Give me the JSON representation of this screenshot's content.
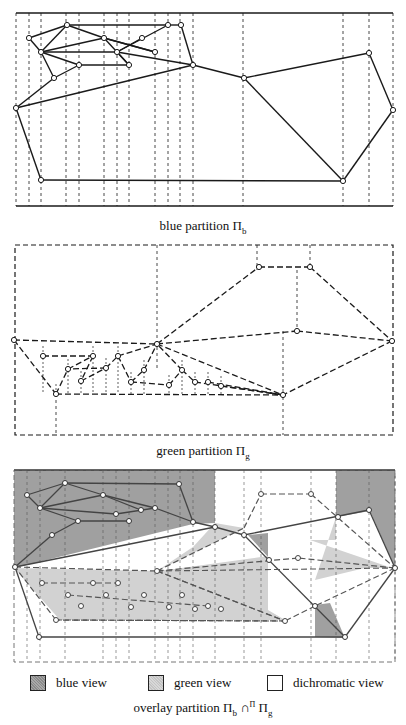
{
  "colors": {
    "line": "#1a1a1a",
    "blue_view": "#a0a0a0",
    "green_view": "#d2d2d2",
    "dichromatic_view": "#ffffff"
  },
  "captions": {
    "blue": {
      "text": "blue partition Π",
      "sub": "b"
    },
    "green": {
      "text": "green partition Π",
      "sub": "g"
    },
    "overlay": {
      "pre": "overlay partition Π",
      "sub1": "b",
      "op": " ∩",
      "sup": "Π",
      "post": " Π",
      "sub2": "g"
    }
  },
  "legend": [
    {
      "key": "blue",
      "label": "blue view"
    },
    {
      "key": "green",
      "label": "green view"
    },
    {
      "key": "dichromatic",
      "label": "dichromatic view"
    }
  ],
  "diagrams": {
    "blue": {
      "frame": [
        16,
        13,
        393,
        206
      ],
      "vlines": [
        16,
        29,
        41,
        66,
        79,
        104,
        117,
        129,
        155,
        168,
        180,
        193,
        243,
        343,
        369,
        393
      ],
      "nodes": [
        [
          67,
          25
        ],
        [
          168,
          25
        ],
        [
          181,
          25
        ],
        [
          29,
          38
        ],
        [
          104,
          38
        ],
        [
          142,
          38
        ],
        [
          41,
          52
        ],
        [
          117,
          52
        ],
        [
          155,
          52
        ],
        [
          79,
          65
        ],
        [
          129,
          65
        ],
        [
          193,
          65
        ],
        [
          54,
          78
        ],
        [
          244,
          78
        ],
        [
          369,
          53
        ],
        [
          16,
          108
        ],
        [
          393,
          110
        ],
        [
          41,
          180
        ],
        [
          343,
          181
        ]
      ],
      "edges": [
        [
          0,
          1
        ],
        [
          0,
          3
        ],
        [
          0,
          6
        ],
        [
          0,
          4
        ],
        [
          1,
          2
        ],
        [
          1,
          7
        ],
        [
          2,
          11
        ],
        [
          3,
          6
        ],
        [
          6,
          4
        ],
        [
          6,
          7
        ],
        [
          6,
          9
        ],
        [
          6,
          12
        ],
        [
          4,
          8
        ],
        [
          4,
          7
        ],
        [
          5,
          7
        ],
        [
          7,
          10
        ],
        [
          7,
          11
        ],
        [
          8,
          4
        ],
        [
          9,
          12
        ],
        [
          9,
          10
        ],
        [
          10,
          7
        ],
        [
          11,
          13
        ],
        [
          12,
          15
        ],
        [
          15,
          11
        ],
        [
          13,
          14
        ],
        [
          13,
          18
        ],
        [
          14,
          16
        ],
        [
          16,
          18
        ],
        [
          15,
          17
        ],
        [
          17,
          18
        ]
      ]
    },
    "green": {
      "frame": [
        15,
        245,
        393,
        435
      ],
      "nodes": [
        [
          14,
          340
        ],
        [
          157,
          344
        ],
        [
          259,
          267
        ],
        [
          310,
          267
        ],
        [
          297,
          331
        ],
        [
          392,
          341
        ],
        [
          283,
          395
        ],
        [
          43,
          356
        ],
        [
          68,
          369
        ],
        [
          93,
          356
        ],
        [
          106,
          368
        ],
        [
          118,
          356
        ],
        [
          81,
          381
        ],
        [
          131,
          382
        ],
        [
          144,
          370
        ],
        [
          169,
          385
        ],
        [
          182,
          370
        ],
        [
          195,
          382
        ],
        [
          208,
          382
        ],
        [
          221,
          386
        ],
        [
          56,
          394
        ]
      ],
      "edges": [
        [
          0,
          1
        ],
        [
          0,
          20
        ],
        [
          1,
          2
        ],
        [
          2,
          3
        ],
        [
          3,
          5
        ],
        [
          1,
          4
        ],
        [
          4,
          5
        ],
        [
          5,
          6
        ],
        [
          1,
          6
        ],
        [
          20,
          8
        ],
        [
          8,
          9
        ],
        [
          9,
          12
        ],
        [
          12,
          10
        ],
        [
          10,
          11
        ],
        [
          11,
          13
        ],
        [
          13,
          14
        ],
        [
          14,
          1
        ],
        [
          10,
          8
        ],
        [
          11,
          1
        ],
        [
          7,
          9
        ],
        [
          13,
          15
        ],
        [
          15,
          16
        ],
        [
          16,
          1
        ],
        [
          16,
          17
        ],
        [
          17,
          6
        ],
        [
          18,
          6
        ],
        [
          19,
          6
        ],
        [
          20,
          6
        ]
      ]
    },
    "overlay": {
      "frame": [
        14,
        470,
        395,
        662
      ],
      "blue_regions": [
        "14,470 215,470 215,523 193,524 14,568",
        "336,470 395,470 395,568 370,511 336,517",
        "248,535 268,533 268,557",
        "315,605 330,603 345,638 315,637"
      ],
      "green_regions": [
        "14,568 157,571 268,560 268,610 285,620 60,620",
        "215,523 244,528 157,571 193,547",
        "310,540 392,568 365,568 315,580 336,517 336,540",
        "160,571 268,556 268,610"
      ],
      "blue_nodes": [
        [
          65,
          483
        ],
        [
          179,
          484
        ],
        [
          27,
          495
        ],
        [
          103,
          495
        ],
        [
          141,
          510
        ],
        [
          40,
          508
        ],
        [
          116,
          514
        ],
        [
          155,
          508
        ],
        [
          78,
          521
        ],
        [
          129,
          521
        ],
        [
          193,
          522
        ],
        [
          52,
          535
        ],
        [
          215,
          527
        ],
        [
          244,
          535
        ],
        [
          369,
          510
        ],
        [
          15,
          567
        ],
        [
          395,
          568
        ],
        [
          39,
          637
        ],
        [
          345,
          637
        ],
        [
          338,
          517
        ],
        [
          269,
          560
        ],
        [
          315,
          606
        ]
      ],
      "green_nodes": [
        [
          261,
          494
        ],
        [
          311,
          494
        ],
        [
          157,
          571
        ],
        [
          298,
          558
        ],
        [
          42,
          583
        ],
        [
          68,
          595
        ],
        [
          93,
          583
        ],
        [
          106,
          595
        ],
        [
          118,
          583
        ],
        [
          81,
          606
        ],
        [
          131,
          607
        ],
        [
          144,
          595
        ],
        [
          169,
          607
        ],
        [
          182,
          595
        ],
        [
          195,
          609
        ],
        [
          208,
          606
        ],
        [
          221,
          609
        ],
        [
          56,
          620
        ],
        [
          285,
          621
        ]
      ]
    }
  }
}
